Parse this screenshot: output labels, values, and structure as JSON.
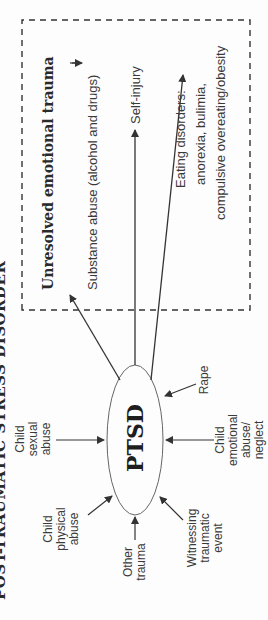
{
  "title": "POST-TRAUMATIC STRESS DISORDER",
  "center": {
    "label": "PTSD"
  },
  "causes": [
    {
      "id": "other-trauma",
      "label": "Other trauma"
    },
    {
      "id": "child-physical-abuse",
      "label": "Child physical abuse"
    },
    {
      "id": "witnessing-traumatic-event",
      "label": "Witnessing traumatic event"
    },
    {
      "id": "child-sexual-abuse",
      "label": "Child sexual abuse"
    },
    {
      "id": "child-emotional-abuse",
      "label": "Child emotional abuse/ neglect"
    },
    {
      "id": "rape",
      "label": "Rape"
    }
  ],
  "outcomes_box": {
    "heading": "Unresolved emotional trauma",
    "items": [
      {
        "id": "substance-abuse",
        "label": "Substance abuse (alcohol and drugs)"
      },
      {
        "id": "self-injury",
        "label": "Self-injury"
      },
      {
        "id": "eating-disorders",
        "lines": [
          "Eating disorders:",
          "anorexia, bulimia,",
          "compulsive overeating/obesity"
        ]
      }
    ]
  },
  "colors": {
    "line": "#333333",
    "text": "#3a3a3a",
    "background": "#fdfdfd"
  }
}
